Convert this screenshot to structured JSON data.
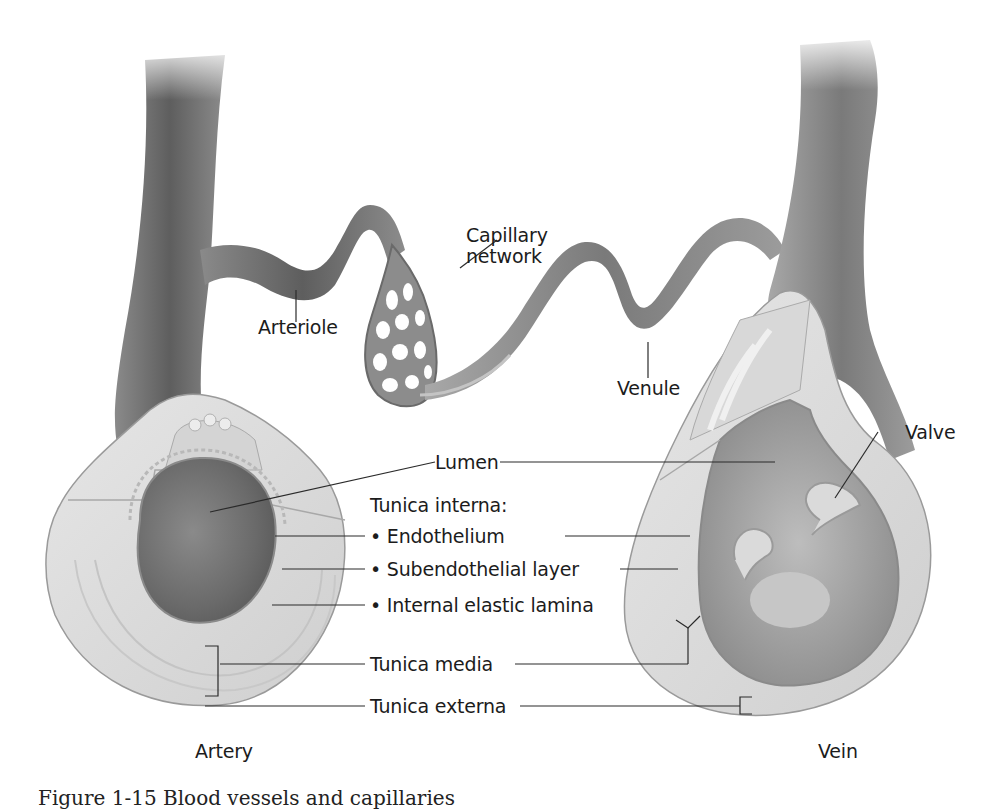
{
  "figure": {
    "caption_partial": "Figure 1-15 Blood vessels and capillaries"
  },
  "labels": {
    "capillary_network": [
      "Capillary",
      "network"
    ],
    "arteriole": "Arteriole",
    "venule": "Venule",
    "valve": "Valve",
    "lumen": "Lumen",
    "tunica_interna": "Tunica interna:",
    "endothelium": "• Endothelium",
    "subendothelial": "• Subendothelial layer",
    "internal_elastic": "• Internal elastic lamina",
    "tunica_media": "Tunica media",
    "tunica_externa": "Tunica externa",
    "artery": "Artery",
    "vein": "Vein"
  },
  "colors": {
    "vessel_dark": "#6e6e6e",
    "vessel_mid": "#9a9a9a",
    "vessel_light": "#c8c8c8",
    "wall": "#dcdcdc",
    "lumen": "#7a7a7a",
    "leader": "#2a2a2a",
    "text": "#1c1c1c"
  }
}
